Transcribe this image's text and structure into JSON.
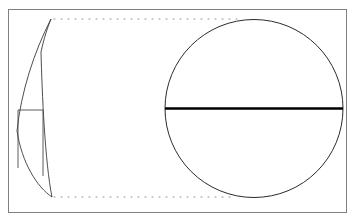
{
  "figure": {
    "domain": "Diagram",
    "kind": "geometric-line-drawing",
    "background_color": "#ffffff",
    "caption_remnant_text": "i",
    "canvas": {
      "width": 358,
      "height": 222
    },
    "frame": {
      "name": "figure-border",
      "x": 8,
      "y": 9,
      "width": 339,
      "height": 204,
      "stroke_color": "#808080",
      "stroke_width": 1,
      "fill": "none"
    },
    "shapes": [
      {
        "name": "crescent-blade",
        "type": "crescent",
        "stroke_color": "#3a3a3a",
        "stroke_width": 0.9,
        "fill": "none",
        "tip_top": {
          "x": 51,
          "y": 19
        },
        "tip_bottom": {
          "x": 52,
          "y": 197
        },
        "outer_arc_bulge_x": 17,
        "inner_arc_bulge_x": 41
      },
      {
        "name": "rectangle-handle",
        "type": "rectangle-open-bottom",
        "stroke_color": "#4a4a4a",
        "stroke_width": 0.9,
        "fill": "none",
        "left": 18,
        "top": 110,
        "right": 43,
        "extends_below": true
      },
      {
        "name": "circle-outline",
        "type": "circle",
        "stroke_color": "#2b2b2b",
        "stroke_width": 1,
        "fill": "none",
        "center_x": 254,
        "center_y": 108.5,
        "radius": 89
      },
      {
        "name": "circle-diameter-line",
        "type": "line",
        "stroke_color": "#000000",
        "stroke_width": 2.4,
        "x1": 165,
        "y1": 108.5,
        "x2": 343,
        "y2": 108.5
      },
      {
        "name": "top-dotted-guide",
        "type": "dotted-line",
        "stroke_color": "#9a9a9a",
        "stroke_width": 1.2,
        "dash": "1 6",
        "x1": 54,
        "y1": 19,
        "x2": 241,
        "y2": 19
      },
      {
        "name": "bottom-dotted-guide",
        "type": "dotted-line",
        "stroke_color": "#9a9a9a",
        "stroke_width": 1.2,
        "dash": "1 6",
        "x1": 54,
        "y1": 197,
        "x2": 236,
        "y2": 197
      }
    ]
  }
}
